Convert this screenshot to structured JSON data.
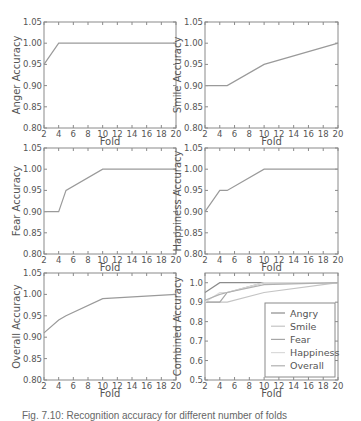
{
  "caption": "Fig. 7.10: Recognition accuracy for different number of folds",
  "colors": {
    "axis": "#8a8a8a",
    "text": "#555555",
    "line": "#9a9a9a"
  },
  "chart_data": [
    {
      "type": "line",
      "title": "",
      "xlabel": "Fold",
      "ylabel": "Anger Accuracy",
      "xlim": [
        2,
        20
      ],
      "ylim": [
        0.8,
        1.05
      ],
      "xticks": [
        2,
        4,
        6,
        8,
        10,
        12,
        14,
        16,
        18,
        20
      ],
      "yticks": [
        "0.80",
        "0.85",
        "0.90",
        "0.95",
        "1.00",
        "1.05"
      ],
      "grid": false,
      "series": [
        {
          "name": "Anger",
          "x": [
            2,
            4,
            5,
            10,
            20
          ],
          "values": [
            0.95,
            1.0,
            1.0,
            1.0,
            1.0
          ],
          "color": "#9a9a9a"
        }
      ]
    },
    {
      "type": "line",
      "title": "",
      "xlabel": "Fold",
      "ylabel": "Smile Accuracy",
      "xlim": [
        2,
        20
      ],
      "ylim": [
        0.8,
        1.05
      ],
      "xticks": [
        2,
        4,
        6,
        8,
        10,
        12,
        14,
        16,
        18,
        20
      ],
      "yticks": [
        "0.80",
        "0.85",
        "0.90",
        "0.95",
        "1.00",
        "1.05"
      ],
      "grid": false,
      "series": [
        {
          "name": "Smile",
          "x": [
            2,
            4,
            5,
            10,
            20
          ],
          "values": [
            0.9,
            0.9,
            0.9,
            0.95,
            1.0
          ],
          "color": "#9a9a9a"
        }
      ]
    },
    {
      "type": "line",
      "title": "",
      "xlabel": "Fold",
      "ylabel": "Fear Accuracy",
      "xlim": [
        2,
        20
      ],
      "ylim": [
        0.8,
        1.05
      ],
      "xticks": [
        2,
        4,
        6,
        8,
        10,
        12,
        14,
        16,
        18,
        20
      ],
      "yticks": [
        "0.80",
        "0.85",
        "0.90",
        "0.95",
        "1.00",
        "1.05"
      ],
      "grid": false,
      "series": [
        {
          "name": "Fear",
          "x": [
            2,
            4,
            5,
            10,
            20
          ],
          "values": [
            0.9,
            0.9,
            0.95,
            1.0,
            1.0
          ],
          "color": "#9a9a9a"
        }
      ]
    },
    {
      "type": "line",
      "title": "",
      "xlabel": "Fold",
      "ylabel": "Happiness Accuracy",
      "xlim": [
        2,
        20
      ],
      "ylim": [
        0.8,
        1.05
      ],
      "xticks": [
        2,
        4,
        6,
        8,
        10,
        12,
        14,
        16,
        18,
        20
      ],
      "yticks": [
        "0.80",
        "0.85",
        "0.90",
        "0.95",
        "1.00",
        "1.05"
      ],
      "grid": false,
      "series": [
        {
          "name": "Happiness",
          "x": [
            2,
            4,
            5,
            10,
            20
          ],
          "values": [
            0.9,
            0.95,
            0.95,
            1.0,
            1.0
          ],
          "color": "#9a9a9a"
        }
      ]
    },
    {
      "type": "line",
      "title": "",
      "xlabel": "Fold",
      "ylabel": "Overall Accuracy",
      "xlim": [
        2,
        20
      ],
      "ylim": [
        0.8,
        1.05
      ],
      "xticks": [
        2,
        4,
        6,
        8,
        10,
        12,
        14,
        16,
        18,
        20
      ],
      "yticks": [
        "0.80",
        "0.85",
        "0.90",
        "0.95",
        "1.00",
        "1.05"
      ],
      "grid": false,
      "series": [
        {
          "name": "Overall",
          "x": [
            2,
            4,
            5,
            10,
            20
          ],
          "values": [
            0.91,
            0.94,
            0.95,
            0.99,
            1.0
          ],
          "color": "#9a9a9a"
        }
      ]
    },
    {
      "type": "line",
      "title": "",
      "xlabel": "Fold",
      "ylabel": "Combined Accuracy",
      "xlim": [
        2,
        20
      ],
      "ylim": [
        0.5,
        1.05
      ],
      "xticks": [
        2,
        4,
        6,
        8,
        10,
        12,
        14,
        16,
        18,
        20
      ],
      "yticks": [
        "0.5",
        "0.6",
        "0.7",
        "0.8",
        "0.9",
        "1.0"
      ],
      "grid": false,
      "legend_position": "lower right",
      "series": [
        {
          "name": "Angry",
          "x": [
            2,
            4,
            5,
            10,
            20
          ],
          "values": [
            0.95,
            1.0,
            1.0,
            1.0,
            1.0
          ],
          "color": "#8c8c8c"
        },
        {
          "name": "Smile",
          "x": [
            2,
            4,
            5,
            10,
            20
          ],
          "values": [
            0.9,
            0.9,
            0.9,
            0.95,
            1.0
          ],
          "color": "#c4c4c4"
        },
        {
          "name": "Fear",
          "x": [
            2,
            4,
            5,
            10,
            20
          ],
          "values": [
            0.9,
            0.9,
            0.95,
            1.0,
            1.0
          ],
          "color": "#a6a6a6"
        },
        {
          "name": "Happiness",
          "x": [
            2,
            4,
            5,
            10,
            20
          ],
          "values": [
            0.9,
            0.95,
            0.95,
            1.0,
            1.0
          ],
          "color": "#dadada"
        },
        {
          "name": "Overall",
          "x": [
            2,
            4,
            5,
            10,
            20
          ],
          "values": [
            0.91,
            0.94,
            0.95,
            0.99,
            1.0
          ],
          "color": "#b0b0b0"
        }
      ]
    }
  ],
  "panels_layout": [
    {
      "left": 44,
      "top": 22,
      "width": 132,
      "height": 106
    },
    {
      "left": 205,
      "top": 22,
      "width": 133,
      "height": 106
    },
    {
      "left": 44,
      "top": 148,
      "width": 132,
      "height": 106
    },
    {
      "left": 205,
      "top": 148,
      "width": 133,
      "height": 106
    },
    {
      "left": 44,
      "top": 273,
      "width": 132,
      "height": 107
    },
    {
      "left": 205,
      "top": 273,
      "width": 133,
      "height": 107
    }
  ]
}
